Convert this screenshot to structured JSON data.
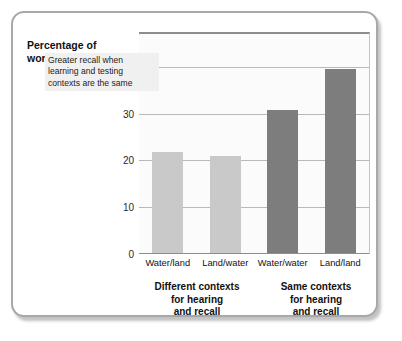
{
  "chart_data": {
    "type": "bar",
    "title": "",
    "ylabel": "Percentage of words recalled",
    "xlabel": "",
    "ylim": [
      0,
      47
    ],
    "grid": true,
    "legend": "none",
    "categories": [
      "Water/land",
      "Land/water",
      "Water/water",
      "Land/land"
    ],
    "values": [
      21.5,
      20.7,
      30.6,
      39.3
    ],
    "bar_colors": [
      "#c9c9c9",
      "#c9c9c9",
      "#7d7d7d",
      "#7d7d7d"
    ],
    "y_ticks": [
      {
        "value": 0,
        "label": "0"
      },
      {
        "value": 10,
        "label": "10"
      },
      {
        "value": 20,
        "label": "20"
      },
      {
        "value": 30,
        "label": "30"
      },
      {
        "value": 40,
        "label": "40%"
      }
    ],
    "annotations": [
      {
        "name": "greater-recall-note",
        "lines": [
          "Greater recall when",
          "learning and testing",
          "contexts are the same"
        ]
      }
    ],
    "groups": [
      {
        "name": "different-contexts",
        "lines": [
          "Different contexts",
          "for hearing",
          "and recall"
        ],
        "categories": [
          "Water/land",
          "Land/water"
        ]
      },
      {
        "name": "same-contexts",
        "lines": [
          "Same contexts",
          "for hearing",
          "and recall"
        ],
        "categories": [
          "Water/water",
          "Land/land"
        ]
      }
    ]
  },
  "axis_title": {
    "line1": "Percentage of",
    "line2": "words recalled"
  },
  "colors": {
    "card_border": "#a8a8a8",
    "plot_background": "#fbfbfb",
    "gridline": "#b9b9b9",
    "axis": "#8d8d8d",
    "bar_light": "#c9c9c9",
    "bar_dark": "#7d7d7d",
    "annotation_background": "#f0f0f0",
    "text": "#111111"
  }
}
